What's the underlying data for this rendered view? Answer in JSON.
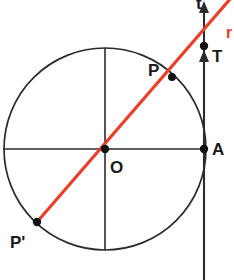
{
  "figure": {
    "canvas": {
      "width": 234,
      "height": 280,
      "background": "#ffffff"
    },
    "colors": {
      "stroke": "#2b2b2b",
      "point": "#111111",
      "secant_red": "#e8402a",
      "label": "#1a1a1a"
    },
    "circle": {
      "name": "main-circle",
      "center_x": 105,
      "center_y": 149,
      "radius": 101
    },
    "axes": {
      "horizontal": {
        "x1": 3,
        "y1": 149,
        "x2": 207,
        "y2": 149
      },
      "vertical": {
        "x1": 105,
        "y1": 48,
        "x2": 105,
        "y2": 250
      }
    },
    "tangent": {
      "name": "tangent-line-t",
      "x": 204,
      "y_top": 6,
      "y_bottom": 280,
      "label": "t",
      "label_x": 196,
      "label_y": 9,
      "arrow_top_y": 3,
      "arrow_mid_y": 52
    },
    "secant": {
      "name": "secant-line-r",
      "x1": 37,
      "y1": 222,
      "x2": 231,
      "y2": -2,
      "label": "r",
      "label_x": 226,
      "label_y": 38
    },
    "points": [
      {
        "id": "P",
        "label": "P",
        "x": 172,
        "y": 77,
        "label_x": 148,
        "label_y": 76,
        "dot_r": 4.0
      },
      {
        "id": "T",
        "label": "T",
        "x": 204,
        "y": 46,
        "label_x": 212,
        "label_y": 62,
        "dot_r": 4.2
      },
      {
        "id": "A",
        "label": "A",
        "x": 204,
        "y": 149,
        "label_x": 212,
        "label_y": 155,
        "dot_r": 4.2
      },
      {
        "id": "O",
        "label": "O",
        "x": 105,
        "y": 149,
        "label_x": 110,
        "label_y": 173,
        "dot_r": 4.2
      },
      {
        "id": "Pp",
        "label": "P'",
        "x": 37,
        "y": 222,
        "label_x": 10,
        "label_y": 248,
        "dot_r": 4.2
      }
    ]
  }
}
